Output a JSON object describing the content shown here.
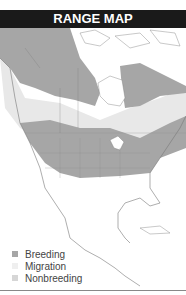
{
  "header": {
    "title": "RANGE MAP"
  },
  "legend": {
    "items": [
      {
        "label": "Breeding",
        "color": "#a6a6a6"
      },
      {
        "label": "Migration",
        "color": "#efefef"
      },
      {
        "label": "Nonbreeding",
        "color": "#d6d6d6"
      }
    ]
  },
  "colors": {
    "breeding": "#a6a6a6",
    "migration": "#e6e6e6",
    "nonbreeding": "#d6d6d6",
    "border": "#777777"
  }
}
